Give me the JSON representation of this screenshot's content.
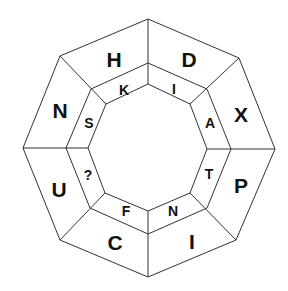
{
  "puzzle": {
    "type": "octagon-letter-ring",
    "outer_ring": [
      "H",
      "D",
      "X",
      "P",
      "I",
      "C",
      "U",
      "N"
    ],
    "inner_ring": [
      "K",
      "I",
      "A",
      "T",
      "N",
      "F",
      "?",
      "S"
    ],
    "missing_marker": "?"
  },
  "labels": {
    "outer": {
      "top_left": "H",
      "top_right": "D",
      "right_top": "X",
      "right_bottom": "P",
      "bottom_right": "I",
      "bottom_left": "C",
      "left_bottom": "U",
      "left_top": "N"
    },
    "inner": {
      "top_left": "K",
      "top_right": "I",
      "right_top": "A",
      "right_bottom": "T",
      "bottom_right": "N",
      "bottom_left": "F",
      "left_bottom": "?",
      "left_top": "S"
    }
  },
  "colors": {
    "line": "#333333",
    "text": "#111111",
    "background": "#ffffff"
  }
}
